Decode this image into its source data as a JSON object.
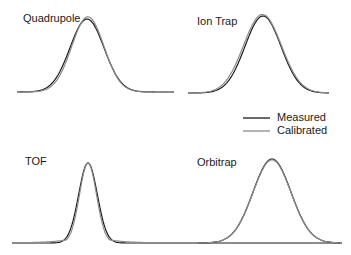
{
  "chart_data": {
    "type": "line",
    "title": "",
    "legend": {
      "position": "right-middle",
      "entries": [
        {
          "name": "Measured",
          "color": "#1a1a1a"
        },
        {
          "name": "Calibrated",
          "color": "#8a8a8a"
        }
      ]
    },
    "xlabel": "",
    "ylabel": "",
    "grid": false,
    "axes": false,
    "panels": [
      {
        "name": "Quadrupole",
        "series": [
          {
            "name": "Measured",
            "shape": "gaussian",
            "center": 0.0,
            "width": 1.0,
            "height": 1.0
          },
          {
            "name": "Calibrated",
            "shape": "gaussian",
            "center": 0.05,
            "width": 0.95,
            "height": 1.03
          }
        ]
      },
      {
        "name": "Ion Trap",
        "series": [
          {
            "name": "Measured",
            "shape": "gaussian",
            "center": 0.0,
            "width": 1.0,
            "height": 1.0
          },
          {
            "name": "Calibrated",
            "shape": "gaussian",
            "center": -0.03,
            "width": 1.05,
            "height": 1.02
          }
        ]
      },
      {
        "name": "TOF",
        "series": [
          {
            "name": "Measured",
            "shape": "gaussian",
            "center": 0.0,
            "width": 0.55,
            "height": 1.0
          },
          {
            "name": "Calibrated",
            "shape": "gaussian-tailed",
            "center": 0.0,
            "width": 0.5,
            "height": 1.0
          }
        ]
      },
      {
        "name": "Orbitrap",
        "series": [
          {
            "name": "Measured",
            "shape": "gaussian",
            "center": 0.0,
            "width": 1.0,
            "height": 1.0
          },
          {
            "name": "Calibrated",
            "shape": "gaussian",
            "center": 0.0,
            "width": 1.0,
            "height": 0.99
          }
        ]
      }
    ]
  },
  "labels": {
    "quadrupole": "Quadrupole",
    "iontrap": "Ion Trap",
    "tof": "TOF",
    "orbitrap": "Orbitrap",
    "measured": "Measured",
    "calibrated": "Calibrated"
  }
}
